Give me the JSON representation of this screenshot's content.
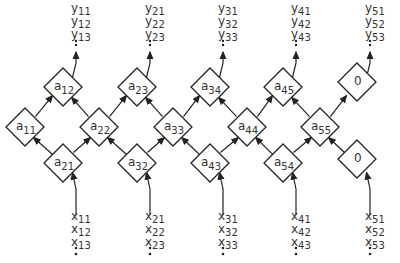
{
  "diagram": {
    "type": "systolic-array",
    "top_row": [
      {
        "id": "a12",
        "base": "a",
        "sub": "12"
      },
      {
        "id": "a23",
        "base": "a",
        "sub": "23"
      },
      {
        "id": "a34",
        "base": "a",
        "sub": "34"
      },
      {
        "id": "a45",
        "base": "a",
        "sub": "45"
      },
      {
        "id": "zero_top",
        "base": "0",
        "sub": ""
      }
    ],
    "middle_row": [
      {
        "id": "a11",
        "base": "a",
        "sub": "11"
      },
      {
        "id": "a22",
        "base": "a",
        "sub": "22"
      },
      {
        "id": "a33",
        "base": "a",
        "sub": "33"
      },
      {
        "id": "a44",
        "base": "a",
        "sub": "44"
      },
      {
        "id": "a55",
        "base": "a",
        "sub": "55"
      }
    ],
    "bottom_row": [
      {
        "id": "a21",
        "base": "a",
        "sub": "21"
      },
      {
        "id": "a32",
        "base": "a",
        "sub": "32"
      },
      {
        "id": "a43",
        "base": "a",
        "sub": "43"
      },
      {
        "id": "a54",
        "base": "a",
        "sub": "54"
      },
      {
        "id": "zero_bottom",
        "base": "0",
        "sub": ""
      }
    ],
    "outputs": [
      [
        "y11",
        "y12",
        "y13"
      ],
      [
        "y21",
        "y22",
        "y23"
      ],
      [
        "y31",
        "y32",
        "y33"
      ],
      [
        "y41",
        "y42",
        "y43"
      ],
      [
        "y51",
        "y52",
        "y53"
      ]
    ],
    "inputs": [
      [
        "x11",
        "x12",
        "x13"
      ],
      [
        "x21",
        "x22",
        "x23"
      ],
      [
        "x31",
        "x32",
        "x33"
      ],
      [
        "x41",
        "x42",
        "x43"
      ],
      [
        "x51",
        "x52",
        "x53"
      ]
    ],
    "ellipsis": ":"
  }
}
